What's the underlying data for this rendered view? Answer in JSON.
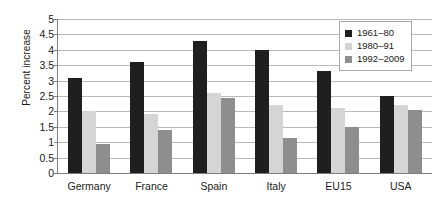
{
  "chart_data": {
    "type": "bar",
    "title": "",
    "xlabel": "",
    "ylabel": "Percent increase",
    "ylim": [
      0,
      5
    ],
    "ytick_step": 0.5,
    "yticks": [
      "5",
      "4.5",
      "4",
      "3.5",
      "3",
      "2.5",
      "2",
      "1.5",
      "1",
      "0.5",
      "0"
    ],
    "grid": true,
    "legend_position": "top-right",
    "categories": [
      "Germany",
      "France",
      "Spain",
      "Italy",
      "EU15",
      "USA"
    ],
    "series": [
      {
        "name": "1961–80",
        "color": "#1f1f1f",
        "values": [
          3.1,
          3.6,
          4.3,
          4.0,
          3.3,
          2.5
        ]
      },
      {
        "name": "1980–91",
        "color": "#d5d5d5",
        "values": [
          2.0,
          1.9,
          2.6,
          2.2,
          2.1,
          2.2
        ]
      },
      {
        "name": "1992–2009",
        "color": "#8e8e8e",
        "values": [
          0.95,
          1.4,
          2.45,
          1.15,
          1.5,
          2.05
        ]
      }
    ]
  }
}
